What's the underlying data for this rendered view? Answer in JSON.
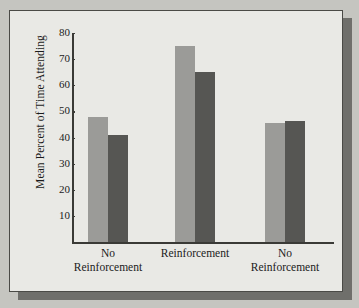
{
  "chart_data": {
    "type": "bar",
    "title": "",
    "xlabel": "",
    "ylabel": "Mean Percent of Time Attending",
    "ylim": [
      0,
      80
    ],
    "yticks": [
      10,
      20,
      30,
      40,
      50,
      60,
      70,
      80
    ],
    "ytick_labels": [
      "10",
      "20",
      "30",
      "40",
      "50",
      "60",
      "70",
      "80"
    ],
    "grid": false,
    "legend": "none",
    "categories": [
      "No Reinforcement",
      "Reinforcement",
      "No Reinforcement"
    ],
    "category_lines": [
      [
        "No",
        "Reinforcement"
      ],
      [
        "Reinforcement"
      ],
      [
        "No",
        "Reinforcement"
      ]
    ],
    "series": [
      {
        "name": "light",
        "color": "#9b9b98",
        "values": [
          48,
          75,
          45.5
        ]
      },
      {
        "name": "dark",
        "color": "#565653",
        "values": [
          41,
          65,
          46.5
        ]
      }
    ]
  },
  "figure": {
    "background": "#e9e9e5",
    "page_background": "#c5c5c0",
    "border_color": "#4a4a46",
    "shadow_color": "#6f6f6b",
    "axis_color": "#3a3a36",
    "text_color": "#1b1b1b"
  }
}
